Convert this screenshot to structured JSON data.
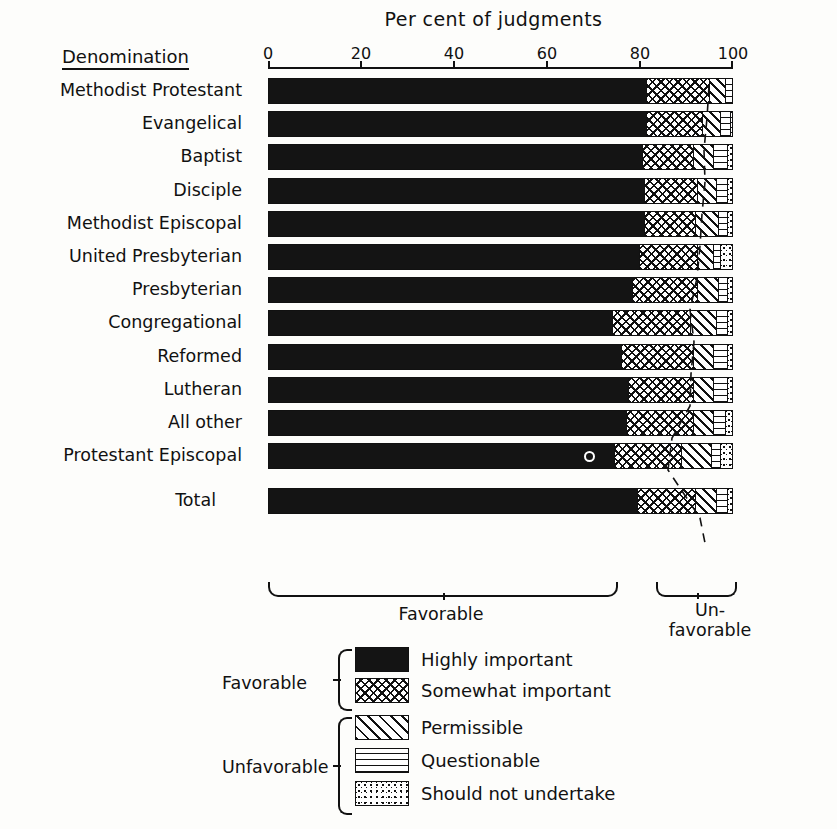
{
  "chart_data": {
    "type": "bar",
    "subtype": "horizontal stacked percentage bar chart",
    "title": "Per cent of judgments",
    "xlabel": "Per cent of judgments",
    "ylabel": "Denomination",
    "xlim": [
      0,
      100
    ],
    "xticks": [
      0,
      20,
      40,
      60,
      80,
      100
    ],
    "xtick_labels": [
      "0",
      "20",
      "40",
      "60",
      "80",
      "100"
    ],
    "grid": false,
    "legend_position": "below chart",
    "categories": [
      "Methodist Protestant",
      "Evangelical",
      "Baptist",
      "Disciple",
      "Methodist Episcopal",
      "United Presbyterian",
      "Presbyterian",
      "Congregational",
      "Reformed",
      "Lutheran",
      "All other",
      "Protestant Episcopal",
      "Total"
    ],
    "series": [
      {
        "name": "Highly important",
        "group": "Favorable",
        "pattern": "solid-black",
        "values": [
          81.5,
          81.5,
          80.5,
          81.0,
          81.0,
          80.0,
          78.5,
          74.0,
          76.0,
          77.5,
          77.0,
          74.5,
          79.5
        ]
      },
      {
        "name": "Somewhat important",
        "group": "Favorable",
        "pattern": "crosshatch",
        "values": [
          13.5,
          12.0,
          11.0,
          11.5,
          11.0,
          12.5,
          14.0,
          17.0,
          15.5,
          14.0,
          14.5,
          14.5,
          12.5
        ]
      },
      {
        "name": "Permissible",
        "group": "Unfavorable",
        "pattern": "diagonal-hatch",
        "values": [
          3.5,
          4.0,
          4.5,
          4.0,
          5.0,
          3.5,
          4.5,
          5.5,
          4.5,
          4.5,
          4.5,
          6.5,
          4.5
        ]
      },
      {
        "name": "Questionable",
        "group": "Unfavorable",
        "pattern": "horizontal-lines",
        "values": [
          1.5,
          2.0,
          3.0,
          2.5,
          2.0,
          1.5,
          2.0,
          2.5,
          3.0,
          3.0,
          2.5,
          2.0,
          2.5
        ]
      },
      {
        "name": "Should not undertake",
        "group": "Unfavorable",
        "pattern": "stipple-dots",
        "values": [
          0.0,
          0.5,
          1.0,
          1.0,
          1.0,
          2.5,
          1.0,
          1.0,
          1.0,
          1.0,
          1.5,
          2.5,
          1.0
        ]
      }
    ],
    "bracket_labels": [
      "Favorable",
      "Un-favorable"
    ],
    "annotations": [
      {
        "row": "Protestant Episcopal",
        "mark": "o",
        "x": 68.0
      }
    ]
  },
  "header": {
    "title": "Per cent of judgments",
    "denomination_header": "Denomination"
  },
  "axis": {
    "ticks": [
      "0",
      "20",
      "40",
      "60",
      "80",
      "100"
    ]
  },
  "brackets": {
    "favorable": "Favorable",
    "unfavorable_line1": "Un-",
    "unfavorable_line2": "favorable"
  },
  "legend": {
    "group_favorable": "Favorable",
    "group_unfavorable": "Unfavorable",
    "items": [
      {
        "label": "Highly important",
        "key": "highly"
      },
      {
        "label": "Somewhat important",
        "key": "somewhat"
      },
      {
        "label": "Permissible",
        "key": "permissible"
      },
      {
        "label": "Questionable",
        "key": "questionable"
      },
      {
        "label": "Should not undertake",
        "key": "shouldnot"
      }
    ]
  },
  "colors": {
    "ink": "#111111",
    "paper": "#fdfdfb"
  }
}
